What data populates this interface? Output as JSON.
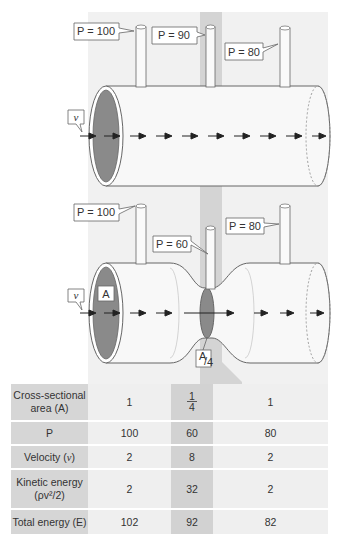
{
  "colors": {
    "panel": "#f1f1f1",
    "constriction_strip": "#d4d4d4",
    "pipe_fill": "#f7f7f7",
    "pipe_outline": "#666666",
    "opening_fill": "#8a8a8a",
    "arrow": "#222222",
    "table_header": "#d6d6d6",
    "table_cell": "#efefef",
    "table_mid": "#d2d2d2"
  },
  "top_diagram": {
    "pressure_labels": [
      "P = 100",
      "P = 90",
      "P = 80"
    ],
    "velocity_label": "v"
  },
  "bottom_diagram": {
    "pressure_labels": [
      "P = 100",
      "P = 60",
      "P = 80"
    ],
    "velocity_label": "v",
    "area_label": "A",
    "constriction_area_label_num": "A",
    "constriction_area_label_den": "4"
  },
  "table": {
    "rows": [
      {
        "label_line1": "Cross-sectional",
        "label_line2": "area (A)",
        "values": [
          "1",
          "1/4",
          "1"
        ]
      },
      {
        "label_line1": "P",
        "label_line2": "",
        "values": [
          "100",
          "60",
          "80"
        ]
      },
      {
        "label_line1": "Velocity (",
        "label_var": "v",
        "label_end": ")",
        "values": [
          "2",
          "8",
          "2"
        ]
      },
      {
        "label_line1": "Kinetic energy",
        "label_line2": "(ρv²/2)",
        "values": [
          "2",
          "32",
          "2"
        ]
      },
      {
        "label_line1": "Total energy (E)",
        "label_line2": "",
        "values": [
          "102",
          "92",
          "82"
        ]
      }
    ],
    "fraction": {
      "num": "1",
      "den": "4"
    }
  }
}
